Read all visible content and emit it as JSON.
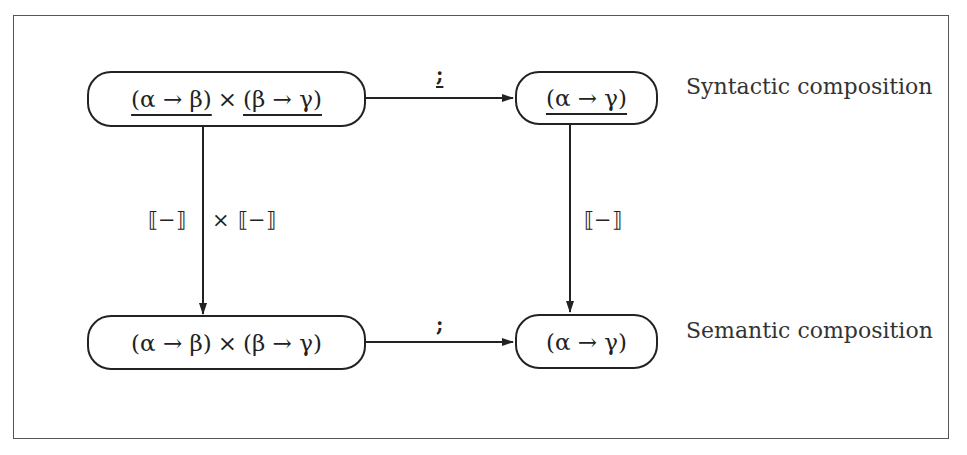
{
  "diagram": {
    "type": "commutative-diagram",
    "nodes": {
      "top_left": {
        "parts": [
          "(α → β)",
          "×",
          "(β → γ)"
        ],
        "underlined": true
      },
      "top_right": {
        "text": "(α → γ)",
        "underlined": true
      },
      "bottom_left": {
        "parts": [
          "(α → β)",
          "×",
          "(β → γ)"
        ],
        "underlined": false
      },
      "bottom_right": {
        "text": "(α → γ)",
        "underlined": false
      }
    },
    "edges": {
      "top": {
        "from": "top_left",
        "to": "top_right",
        "label": ";",
        "underlined": true
      },
      "bottom": {
        "from": "bottom_left",
        "to": "bottom_right",
        "label": ";",
        "underlined": false
      },
      "left": {
        "from": "top_left",
        "to": "bottom_left",
        "label_left": "⟦−⟧",
        "label_op": "×",
        "label_right": "⟦−⟧"
      },
      "right": {
        "from": "top_right",
        "to": "bottom_right",
        "label": "⟦−⟧"
      }
    },
    "row_labels": {
      "top": "Syntactic composition",
      "bottom": "Semantic composition"
    },
    "colors": {
      "stroke": "#222222",
      "frame": "#555555",
      "background": "#ffffff"
    }
  }
}
